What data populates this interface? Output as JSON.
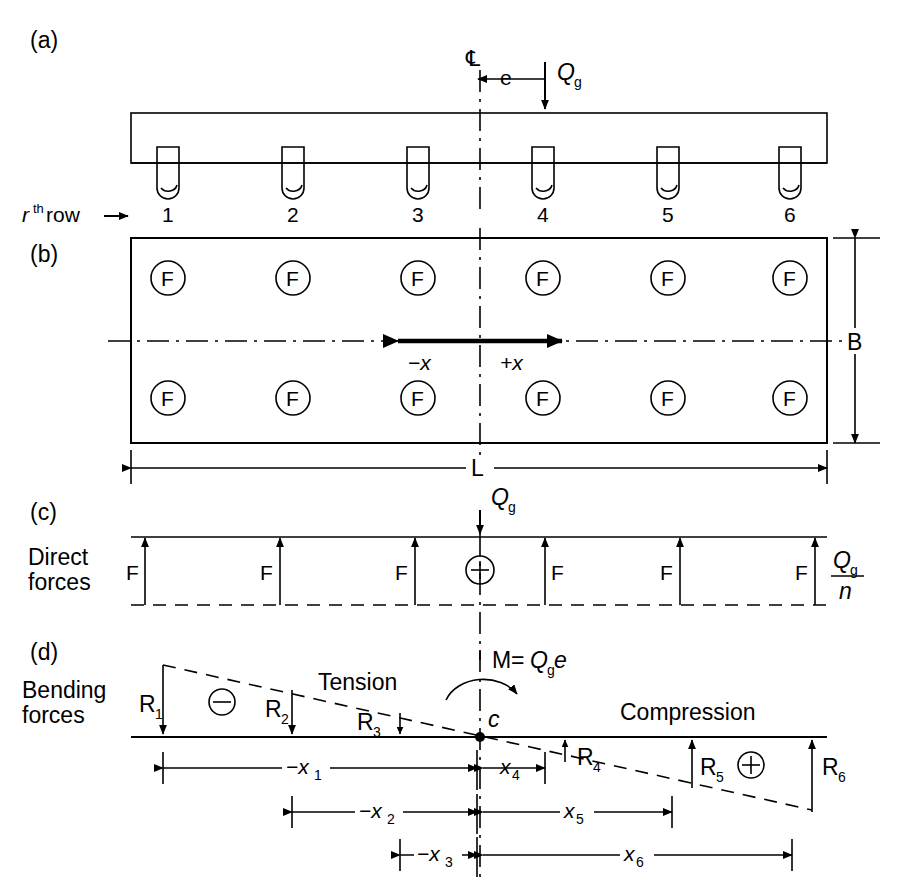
{
  "figure": {
    "panels": [
      {
        "key": "a",
        "label": "(a)",
        "caption": "Elevation of pile cap with eccentric load"
      },
      {
        "key": "b",
        "label": "(b)",
        "caption": "Plan view of pile group"
      },
      {
        "key": "c",
        "label": "(c)",
        "caption": "Direct forces diagram"
      },
      {
        "key": "d",
        "label": "(d)",
        "caption": "Bending forces diagram"
      }
    ]
  },
  "panel_a": {
    "label": "(a)",
    "centerline_symbol": "℄",
    "eccentricity_label": "e",
    "load_label": "Q",
    "load_sub": "g",
    "row_label_r": "r",
    "row_label_sup": "th",
    "row_label_rest": " row",
    "row_arrow": "→",
    "pile_numbers": [
      "1",
      "2",
      "3",
      "4",
      "5",
      "6"
    ],
    "pile_x": [
      168,
      293,
      418,
      543,
      668,
      790
    ],
    "cap_left": 131,
    "cap_right": 827,
    "cap_top": 113,
    "cap_bottom": 163,
    "centerline_x": 480
  },
  "panel_b": {
    "label": "(b)",
    "pile_symbol": "F",
    "width_label": "B",
    "length_label": "L",
    "neg_x_label": "−x",
    "pos_x_label": "+x",
    "rect_left": 131,
    "rect_right": 827,
    "rect_top": 238,
    "rect_bottom": 443,
    "row_top_y": 278,
    "row_bottom_y": 398,
    "axis_y": 341,
    "pile_x": [
      168,
      293,
      418,
      543,
      668,
      790
    ]
  },
  "panel_c": {
    "label": "(c)",
    "title_line1": "Direct",
    "title_line2": "forces",
    "force_symbol": "F",
    "load_label": "Q",
    "load_sub": "g",
    "per_pile_numerator": "Q",
    "per_pile_numerator_sub": "g",
    "per_pile_denominator": "n",
    "plus_symbol": "+",
    "top_y": 537,
    "base_y": 605,
    "left": 131,
    "right": 827,
    "arrow_x": [
      145,
      280,
      415,
      545,
      680,
      815
    ],
    "force_labels_count": 6
  },
  "panel_d": {
    "label": "(d)",
    "title_line1": "Bending",
    "title_line2": "forces",
    "tension_label": "Tension",
    "compression_label": "Compression",
    "moment_label_prefix": "M",
    "moment_equals": "=",
    "moment_Q": "Q",
    "moment_sub": "g",
    "moment_e": "e",
    "centroid_label": "c",
    "minus_symbol": "−",
    "plus_symbol": "+",
    "reactions": [
      {
        "name": "R",
        "sub": "1",
        "x": 163,
        "direction": "down",
        "length": 72,
        "sign": "negative"
      },
      {
        "name": "R",
        "sub": "2",
        "x": 292,
        "direction": "down",
        "length": 47,
        "sign": "negative"
      },
      {
        "name": "R",
        "sub": "3",
        "x": 400,
        "direction": "down",
        "length": 22,
        "sign": "negative"
      },
      {
        "name": "R",
        "sub": "4",
        "x": 565,
        "direction": "up",
        "length": 22,
        "sign": "positive"
      },
      {
        "name": "R",
        "sub": "5",
        "x": 692,
        "direction": "up",
        "length": 48,
        "sign": "positive"
      },
      {
        "name": "R",
        "sub": "6",
        "x": 812,
        "direction": "up",
        "length": 72,
        "sign": "positive"
      }
    ],
    "baseline_y": 737,
    "baseline_left": 131,
    "baseline_right": 827,
    "centerline_x": 480,
    "dimensions": [
      {
        "label": "−x",
        "sub": "1",
        "y": 768,
        "from": 163,
        "to": 480
      },
      {
        "label": "x",
        "sub": "4",
        "y": 768,
        "from": 480,
        "to": 545
      },
      {
        "label": "−x",
        "sub": "2",
        "y": 812,
        "from": 292,
        "to": 480
      },
      {
        "label": "x",
        "sub": "5",
        "y": 812,
        "from": 480,
        "to": 672
      },
      {
        "label": "−x",
        "sub": "3",
        "y": 855,
        "from": 400,
        "to": 480
      },
      {
        "label": "x",
        "sub": "6",
        "y": 855,
        "from": 480,
        "to": 792
      }
    ]
  },
  "colors": {
    "ink": "#000000",
    "paper": "#ffffff"
  }
}
